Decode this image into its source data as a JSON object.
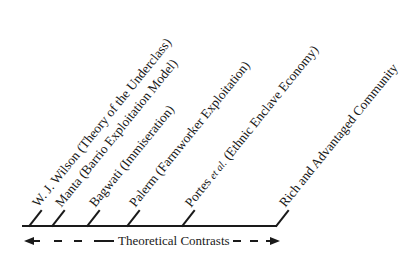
{
  "diagram": {
    "labels": [
      {
        "id": "wilson",
        "text": "W. J. Wilson (Theory of the Underclass)"
      },
      {
        "id": "manta",
        "text": "Manta (Barrio Exploitation Model)"
      },
      {
        "id": "bagwati",
        "text": "Bagwati (Immiseration)"
      },
      {
        "id": "palerm",
        "text": "Palerm (Farmworker Exploitation)"
      },
      {
        "id": "portes",
        "prefix": "Portes ",
        "italic": "et al.",
        "suffix": " (Ethnic Enclave Economy)"
      },
      {
        "id": "rich",
        "text": "Rich and Advantaged Community"
      }
    ],
    "axis_label": "Theoretical Contrasts",
    "arrows": {
      "left": "arrow-left",
      "right": "arrow-right",
      "style": "dashed"
    }
  }
}
